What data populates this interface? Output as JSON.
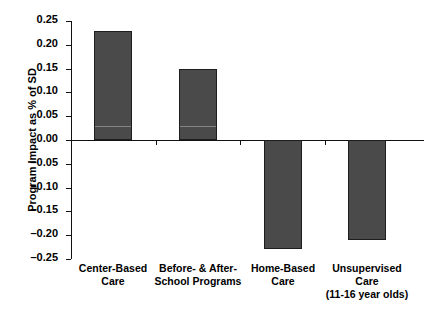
{
  "chart_data": {
    "type": "bar",
    "title": "",
    "xlabel": "",
    "ylabel": "Program Impact as % of SD",
    "categories": [
      "Center-Based\nCare",
      "Before- & After-\nSchool Programs",
      "Home-Based\nCare",
      "Unsupervised\nCare\n(11-16 year olds)"
    ],
    "values": [
      0.23,
      0.15,
      -0.23,
      -0.21
    ],
    "ylim": [
      -0.25,
      0.25
    ],
    "ytick_labels": [
      "0.25",
      "0.20",
      "0.15",
      "0.10",
      "0.05",
      "0.00",
      "-0.05",
      "-0.10",
      "-0.15",
      "-0.20",
      "-0.25"
    ],
    "ytick_values": [
      0.25,
      0.2,
      0.15,
      0.1,
      0.05,
      0.0,
      -0.05,
      -0.1,
      -0.15,
      -0.2,
      -0.25
    ],
    "grid": false,
    "legend": false,
    "bar_color": "#4a4a4a",
    "bar_edge_color": "#1d1d1d",
    "axis_color": "#111111",
    "background": "#ffffff"
  }
}
